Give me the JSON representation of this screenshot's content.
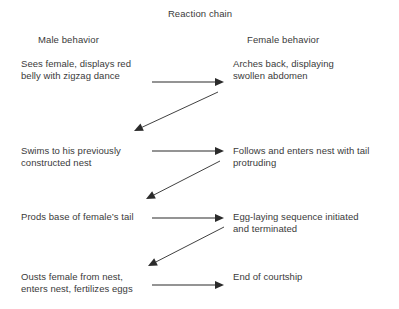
{
  "diagram": {
    "title": "Reaction chain",
    "columns": {
      "left_header": "Male behavior",
      "right_header": "Female behavior"
    },
    "rows": [
      {
        "male": {
          "line1": "Sees female, displays red",
          "line2": "belly with zigzag dance"
        },
        "female": {
          "line1": "Arches back, displaying",
          "line2": "swollen abdomen"
        }
      },
      {
        "male": {
          "line1": "Swims to his previously",
          "line2": "constructed nest"
        },
        "female": {
          "line1": "Follows and enters nest with tail",
          "line2": "protruding"
        }
      },
      {
        "male": {
          "line1": "Prods base of female’s tail",
          "line2": ""
        },
        "female": {
          "line1": "Egg-laying sequence initiated",
          "line2": "and terminated"
        }
      },
      {
        "male": {
          "line1": "Ousts female from nest,",
          "line2": "enters nest, fertilizes eggs"
        },
        "female": {
          "line1": "End of courtship",
          "line2": ""
        }
      }
    ],
    "arrows": {
      "color": "#2b2b2b",
      "forward": [
        {
          "name": "arrow-male1-to-female1",
          "x1": 152,
          "y1": 82,
          "x2": 224,
          "y2": 82
        },
        {
          "name": "arrow-male2-to-female2",
          "x1": 152,
          "y1": 151,
          "x2": 224,
          "y2": 151
        },
        {
          "name": "arrow-male3-to-female3",
          "x1": 152,
          "y1": 218,
          "x2": 224,
          "y2": 218
        },
        {
          "name": "arrow-male4-to-female4",
          "x1": 152,
          "y1": 285,
          "x2": 224,
          "y2": 285
        }
      ],
      "feedback": [
        {
          "name": "arrow-female1-to-male2",
          "x1": 218,
          "y1": 92,
          "x2": 134,
          "y2": 131
        },
        {
          "name": "arrow-female2-to-male3",
          "x1": 220,
          "y1": 161,
          "x2": 146,
          "y2": 199
        },
        {
          "name": "arrow-female3-to-male4",
          "x1": 224,
          "y1": 227,
          "x2": 148,
          "y2": 266
        }
      ]
    }
  }
}
